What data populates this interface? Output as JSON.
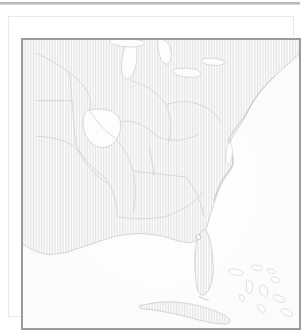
{
  "page": {
    "background_color": "#ffffff",
    "header_rule_color": "#b9b9b9"
  },
  "figure": {
    "frame_color": "#e9e9e9",
    "border_color": "#9b9b9b",
    "caption": "",
    "title": ""
  },
  "map": {
    "name": "southeastern-united-states-map",
    "projection_hint": "plate-carree",
    "land_fill_style": "vertical-hatch",
    "land_hatch_color": "#e2e2e2",
    "water_fill_color": "#ffffff",
    "coastline_color": "#bdbdbd",
    "state_boundary_color": "#c8c8c8",
    "lon_range": [
      -106.0,
      -66.0
    ],
    "lat_range": [
      18.5,
      48.5
    ],
    "features": {
      "lakes": [
        "Lake Michigan",
        "Lake Superior",
        "Lake Huron",
        "Lake Erie",
        "Lake Ontario"
      ],
      "water_bodies": [
        "Gulf of Mexico",
        "Atlantic Ocean",
        "Chesapeake Bay",
        "Florida Straits"
      ],
      "islands": [
        "Cuba",
        "Bahamas",
        "Andros",
        "Great Abaco",
        "Long Island"
      ],
      "highlighted_region": "Missouri",
      "marker_count": 1
    }
  },
  "chart_data": {
    "type": "map",
    "title": "",
    "xlabel": "",
    "ylabel": "",
    "xlim": [
      -106.0,
      -66.0
    ],
    "ylim": [
      18.5,
      48.5
    ],
    "grid": false,
    "legend": "none",
    "markers": [
      {
        "label": "",
        "lon": -80.6,
        "lat": 28.0
      }
    ],
    "annotations": []
  }
}
